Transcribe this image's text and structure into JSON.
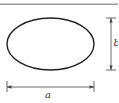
{
  "diagram": {
    "shape": "ellipse",
    "labels": {
      "width": "a",
      "height": "b"
    },
    "colors": {
      "top_rule": "#9a9a9a",
      "outline": "#222222",
      "dimension": "#444444",
      "text": "#333333"
    }
  }
}
